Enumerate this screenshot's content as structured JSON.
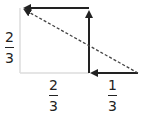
{
  "diagram": {
    "labels": {
      "left": {
        "num": "2",
        "den": "3"
      },
      "bottom_left": {
        "num": "2",
        "den": "3"
      },
      "bottom_right": {
        "num": "1",
        "den": "3"
      }
    },
    "colors": {
      "arrow": "#222222",
      "box": "#dddddd",
      "dashed": "#444444"
    }
  }
}
